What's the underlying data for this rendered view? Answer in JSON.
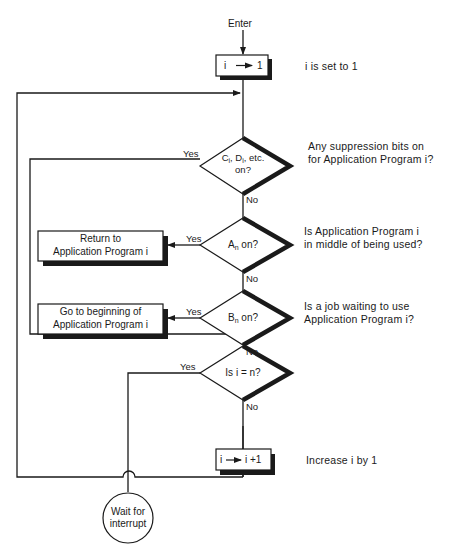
{
  "diagram": {
    "type": "flowchart",
    "start": {
      "label": "Enter"
    },
    "nodes": [
      {
        "id": "init",
        "shape": "process",
        "text": "i → 1",
        "note": "i is set to 1"
      },
      {
        "id": "suppress",
        "shape": "decision",
        "text_line1": "C",
        "text_line1b": "i",
        "text_line1c": ", D",
        "text_line1d": "i",
        "text_line1e": ", etc.",
        "text_line2": "on?",
        "note_line1": "Any suppression bits on",
        "note_line2": "for Application Program i?",
        "yes": "Yes",
        "no": "No"
      },
      {
        "id": "an",
        "shape": "decision",
        "text": "A",
        "sub": "n",
        "text_after": " on?",
        "note_line1": "Is Application Program i",
        "note_line2": "in middle of being used?",
        "yes": "Yes",
        "no": "No"
      },
      {
        "id": "return",
        "shape": "process",
        "text_line1": "Return to",
        "text_line2": "Application Program i"
      },
      {
        "id": "bn",
        "shape": "decision",
        "text": "B",
        "sub": "n",
        "text_after": " on?",
        "note_line1": "Is a job waiting to use",
        "note_line2": "Application Program i?",
        "yes": "Yes",
        "no": "No"
      },
      {
        "id": "goto",
        "shape": "process",
        "text_line1": "Go to beginning of",
        "text_line2": "Application Program i"
      },
      {
        "id": "iequaln",
        "shape": "decision",
        "text": "Is i = n?",
        "yes": "Yes",
        "no": "No"
      },
      {
        "id": "incr",
        "shape": "process",
        "text": "i → i +1",
        "note": "Increase i by 1"
      },
      {
        "id": "wait",
        "shape": "connector",
        "text_line1": "Wait for",
        "text_line2": "interrupt"
      }
    ]
  }
}
